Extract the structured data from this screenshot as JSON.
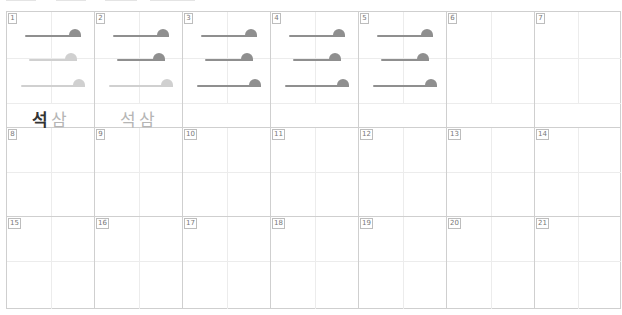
{
  "worksheet": {
    "colors": {
      "grid_line": "#cfcfcf",
      "guide_line": "#ececec",
      "stroke_dark": "#8f8f8f",
      "stroke_light": "#d0d0d0",
      "char_dark": "#333333",
      "char_light": "#b5b5b5"
    },
    "cells": [
      {
        "number": "1",
        "strokes": [
          "dark",
          "light",
          "light"
        ],
        "chars": [
          {
            "text": "석",
            "tone": "dark"
          },
          {
            "text": "삼",
            "tone": "light"
          }
        ]
      },
      {
        "number": "2",
        "strokes": [
          "dark",
          "dark",
          "light"
        ],
        "chars": [
          {
            "text": "석",
            "tone": "light"
          },
          {
            "text": "삼",
            "tone": "light"
          }
        ]
      },
      {
        "number": "3",
        "strokes": [
          "dark",
          "dark",
          "dark"
        ],
        "chars": []
      },
      {
        "number": "4",
        "strokes": [
          "dark",
          "dark",
          "dark"
        ],
        "chars": []
      },
      {
        "number": "5",
        "strokes": [
          "dark",
          "dark",
          "dark"
        ],
        "chars": []
      },
      {
        "number": "6",
        "strokes": [],
        "chars": []
      },
      {
        "number": "7",
        "strokes": [],
        "chars": []
      },
      {
        "number": "8"
      },
      {
        "number": "9"
      },
      {
        "number": "10"
      },
      {
        "number": "11"
      },
      {
        "number": "12"
      },
      {
        "number": "13"
      },
      {
        "number": "14"
      },
      {
        "number": "15"
      },
      {
        "number": "16"
      },
      {
        "number": "17"
      },
      {
        "number": "18"
      },
      {
        "number": "19"
      },
      {
        "number": "20"
      },
      {
        "number": "21"
      }
    ]
  }
}
